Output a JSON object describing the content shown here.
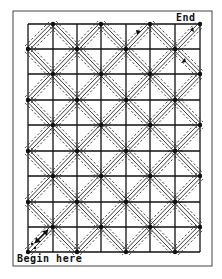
{
  "diagram": {
    "labels": {
      "end": "End",
      "begin": "Begin here"
    },
    "grid": {
      "columns": 7,
      "rows": 9,
      "x_lines": [
        28,
        53,
        77,
        101,
        126,
        150,
        175,
        200
      ],
      "y_lines": [
        24,
        49,
        74,
        100,
        125,
        151,
        176,
        202,
        227,
        252
      ]
    },
    "frame": {
      "x": 13,
      "y": 11,
      "width": 199,
      "height": 255
    },
    "colors": {
      "line": "#111111",
      "frame": "#333333",
      "background": "#ffffff"
    }
  }
}
